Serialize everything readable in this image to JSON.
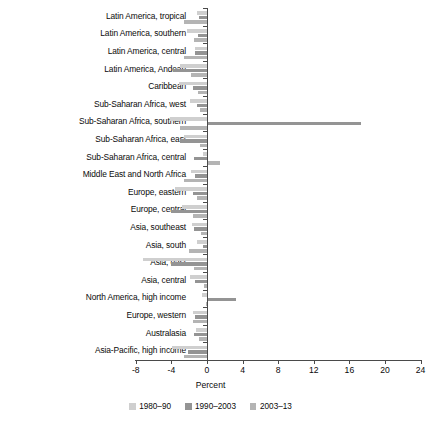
{
  "chart_data": {
    "type": "bar",
    "orientation": "horizontal",
    "title": "",
    "xlabel": "Percent",
    "ylabel": "",
    "xlim": [
      -8,
      24
    ],
    "xticks": [
      -8,
      -4,
      0,
      4,
      8,
      12,
      16,
      20,
      24
    ],
    "xticklabels": [
      "-8",
      "-4",
      "0",
      "4",
      "8",
      "12",
      "16",
      "20",
      "24"
    ],
    "grid": false,
    "legend_position": "bottom",
    "categories": [
      "Latin America, tropical",
      "Latin America, southern",
      "Latin America, central",
      "Latin America, Andean",
      "Caribbean",
      "Sub-Saharan Africa, west",
      "Sub-Saharan Africa, southern",
      "Sub-Saharan Africa, east",
      "Sub-Saharan Africa, central",
      "Middle East and North Africa",
      "Europe, eastern",
      "Europe, central",
      "Asia, southeast",
      "Asia, south",
      "Asia, east",
      "Asia, central",
      "North America, high income",
      "Europe, western",
      "Australasia",
      "Asia-Pacific, high income"
    ],
    "series": [
      {
        "name": "1980–90",
        "color": "#cfcfcf",
        "values": [
          -1.1,
          -2.2,
          -1.3,
          -3.0,
          -3.2,
          -1.9,
          -4.2,
          -2.6,
          -0.4,
          -1.8,
          -3.6,
          -2.8,
          -1.7,
          -1.1,
          -7.2,
          -1.9,
          -0.6,
          -1.6,
          -1.2,
          -3.9
        ]
      },
      {
        "name": "1990–2003",
        "color": "#949494",
        "values": [
          -0.9,
          -1.0,
          -1.4,
          -3.8,
          -1.6,
          -1.1,
          17.2,
          -3.0,
          -1.5,
          -1.3,
          -1.6,
          -4.0,
          -1.5,
          -0.5,
          -4.1,
          -1.4,
          3.2,
          -1.3,
          -1.5,
          -2.1
        ]
      },
      {
        "name": "2003–13",
        "color": "#b4b4b4",
        "values": [
          -2.6,
          -1.5,
          -2.6,
          -1.8,
          -1.0,
          -0.8,
          -3.0,
          -0.8,
          1.4,
          -2.6,
          -1.1,
          -1.6,
          -0.7,
          -2.0,
          -1.5,
          -0.3,
          -0.1,
          -1.6,
          -0.9,
          -2.6
        ]
      }
    ]
  },
  "legend": {
    "items": [
      {
        "label": "1980–90",
        "color": "#cfcfcf"
      },
      {
        "label": "1990–2003",
        "color": "#949494"
      },
      {
        "label": "2003–13",
        "color": "#b4b4b4"
      }
    ]
  }
}
